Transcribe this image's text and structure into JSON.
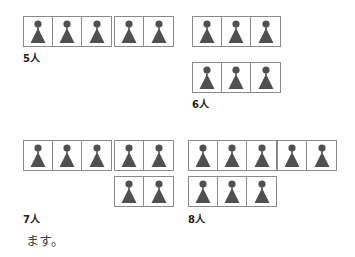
{
  "figures": [
    {
      "label": "5人",
      "label_pos": [
        23,
        50
      ],
      "groups": [
        {
          "x": 23,
          "y": 16,
          "count": 3
        },
        {
          "x": 114,
          "y": 16,
          "count": 2
        }
      ]
    },
    {
      "label": "6人",
      "label_pos": [
        192,
        96
      ],
      "groups": [
        {
          "x": 192,
          "y": 16,
          "count": 3
        },
        {
          "x": 192,
          "y": 62,
          "count": 3
        }
      ]
    },
    {
      "label": "7人",
      "label_pos": [
        23,
        211
      ],
      "groups": [
        {
          "x": 23,
          "y": 140,
          "count": 3
        },
        {
          "x": 114,
          "y": 140,
          "count": 2
        },
        {
          "x": 114,
          "y": 176,
          "count": 2
        }
      ]
    },
    {
      "label": "8人",
      "label_pos": [
        188,
        211
      ],
      "groups": [
        {
          "x": 188,
          "y": 140,
          "count": 3
        },
        {
          "x": 277,
          "y": 140,
          "count": 2
        },
        {
          "x": 188,
          "y": 176,
          "count": 3
        }
      ]
    }
  ],
  "caption": "ます。",
  "colors": {
    "icon": "#505050",
    "border": "#8a8a8a"
  },
  "icon": "person-icon"
}
